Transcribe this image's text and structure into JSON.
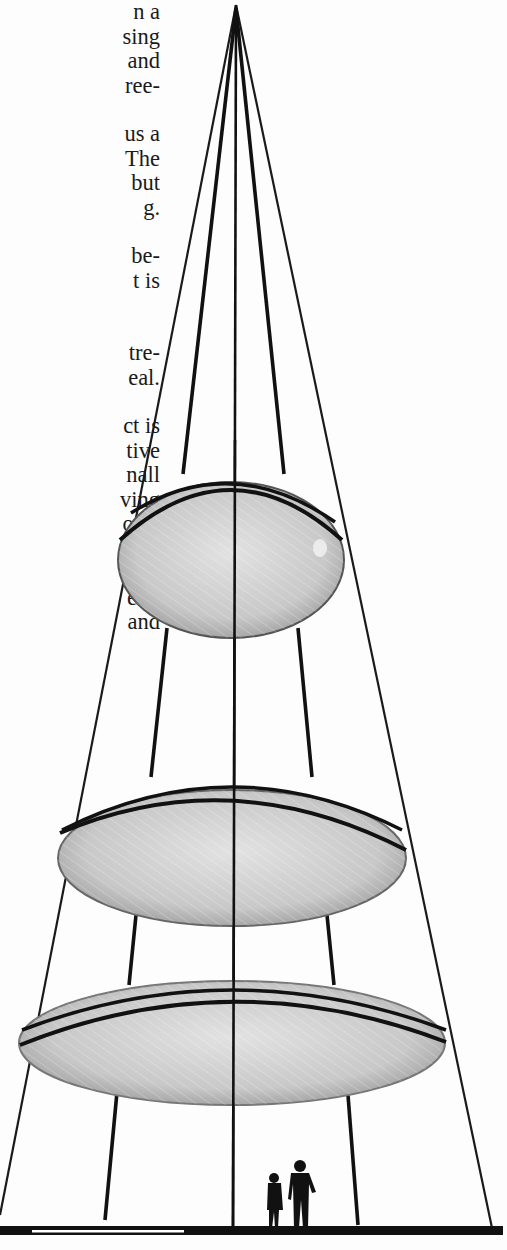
{
  "page": {
    "type": "scanned book page",
    "background": "#fdfdfd",
    "ink_color": "#111111"
  },
  "text_column": {
    "paragraphs": [
      {
        "lines": [
          "n a",
          "sing",
          "and",
          "ree-"
        ]
      },
      {
        "lines": [
          "us a",
          "The",
          "but",
          "g."
        ]
      },
      {
        "lines": [
          "be-",
          "t is"
        ]
      },
      {
        "lines": [
          "tre-",
          "eal."
        ]
      },
      {
        "lines": [
          "ct is",
          "tive",
          "nall",
          "ving",
          "ork-",
          "ives",
          "r it",
          "e to",
          "and"
        ]
      }
    ]
  },
  "illustration": {
    "subject": "conical suspended tower with three hanging disc platforms",
    "apex": {
      "x": 236,
      "y": 5
    },
    "discs": [
      {
        "name": "top-disc",
        "cx": 232,
        "cy": 560,
        "rx": 113,
        "ry": 78,
        "rim_cy": 520
      },
      {
        "name": "middle-disc",
        "cx": 232,
        "cy": 857,
        "rx": 175,
        "ry": 70,
        "rim_cy": 820
      },
      {
        "name": "bottom-disc",
        "cx": 232,
        "cy": 1042,
        "rx": 213,
        "ry": 62,
        "rim_cy": 1010
      }
    ],
    "figures": [
      "woman-silhouette",
      "man-silhouette"
    ],
    "disc_fill": "#c9c9c9",
    "ground_color": "#111111"
  }
}
